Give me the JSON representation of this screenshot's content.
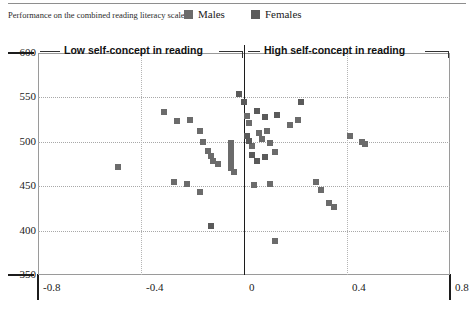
{
  "axis_caption": "Performance on the combined reading literacy scale",
  "legend": {
    "items": [
      {
        "label": "Males",
        "color": "#6b6b6b",
        "icon": "square-swatch-icon"
      },
      {
        "label": "Females",
        "color": "#5a5a5a",
        "icon": "square-swatch-icon"
      }
    ]
  },
  "annotations": {
    "left": "Low self-concept in reading",
    "right": "High self-concept in reading"
  },
  "chart_data": {
    "type": "scatter",
    "title": "",
    "subtitle": "",
    "xlabel": "",
    "ylabel": "Performance on the combined reading literacy scale",
    "xlim": [
      -0.8,
      0.8
    ],
    "ylim": [
      350,
      600
    ],
    "xticks": [
      "-0.8",
      "-0.4",
      "0",
      "0.4",
      "0.8"
    ],
    "xtick_values": [
      -0.8,
      -0.4,
      0,
      0.4,
      0.8
    ],
    "yticks": [
      "600",
      "550",
      "500",
      "450",
      "400",
      "350"
    ],
    "ytick_values": [
      600,
      550,
      500,
      450,
      400,
      350
    ],
    "grid": true,
    "grid_style": "dotted",
    "legend_position": "top-right",
    "reference_line_x": 0,
    "annotations": [
      {
        "text": "Low self-concept in reading",
        "x": -0.35,
        "y": 592
      },
      {
        "text": "High self-concept in reading",
        "x": 0.22,
        "y": 592
      }
    ],
    "series": [
      {
        "name": "Males",
        "color": "#6b6b6b",
        "marker": "square",
        "points": [
          [
            -0.49,
            472
          ],
          [
            -0.31,
            533
          ],
          [
            -0.26,
            523
          ],
          [
            -0.21,
            525
          ],
          [
            -0.17,
            512
          ],
          [
            -0.16,
            500
          ],
          [
            -0.14,
            490
          ],
          [
            -0.13,
            484
          ],
          [
            -0.12,
            478
          ],
          [
            -0.1,
            475
          ],
          [
            -0.27,
            455
          ],
          [
            -0.22,
            452
          ],
          [
            -0.17,
            444
          ],
          [
            -0.05,
            499
          ],
          [
            -0.05,
            494
          ],
          [
            -0.05,
            488
          ],
          [
            -0.05,
            482
          ],
          [
            -0.05,
            476
          ],
          [
            -0.05,
            471
          ],
          [
            -0.04,
            466
          ],
          [
            0.01,
            529
          ],
          [
            0.02,
            521
          ],
          [
            0.03,
            495
          ],
          [
            0.06,
            510
          ],
          [
            0.07,
            503
          ],
          [
            0.09,
            512
          ],
          [
            0.1,
            499
          ],
          [
            0.12,
            488
          ],
          [
            0.04,
            451
          ],
          [
            0.1,
            452
          ],
          [
            0.18,
            519
          ],
          [
            0.21,
            525
          ],
          [
            0.28,
            455
          ],
          [
            0.3,
            446
          ],
          [
            0.33,
            431
          ],
          [
            0.35,
            427
          ],
          [
            0.41,
            507
          ],
          [
            0.46,
            500
          ],
          [
            0.47,
            498
          ],
          [
            0.12,
            388
          ]
        ]
      },
      {
        "name": "Females",
        "color": "#5a5a5a",
        "marker": "square",
        "points": [
          [
            -0.13,
            405
          ],
          [
            -0.02,
            554
          ],
          [
            0.0,
            545
          ],
          [
            0.05,
            535
          ],
          [
            0.08,
            528
          ],
          [
            0.13,
            530
          ],
          [
            0.01,
            507
          ],
          [
            0.02,
            501
          ],
          [
            0.03,
            485
          ],
          [
            0.05,
            478
          ],
          [
            0.08,
            483
          ],
          [
            0.22,
            545
          ]
        ]
      }
    ]
  }
}
